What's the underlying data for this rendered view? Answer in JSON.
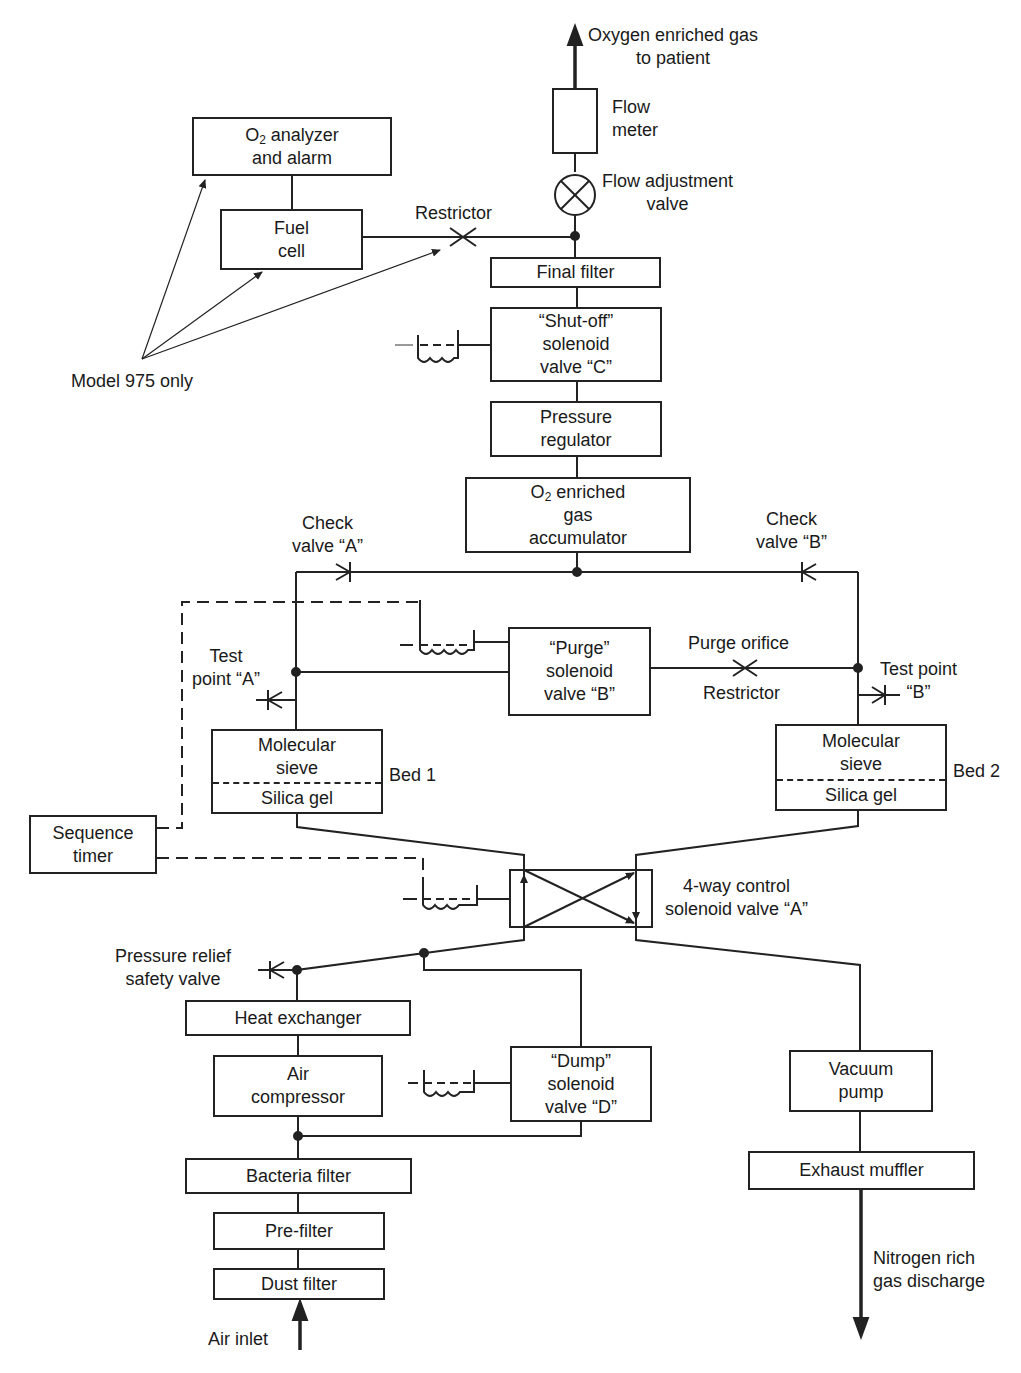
{
  "outputs": {
    "top": [
      "Oxygen enriched gas",
      "to patient"
    ],
    "bottom": [
      "Nitrogen rich",
      "gas discharge"
    ],
    "inlet": "Air inlet"
  },
  "components": {
    "flow_meter": [
      "Flow",
      "meter"
    ],
    "flow_adjustment_valve": [
      "Flow adjustment",
      "valve"
    ],
    "o2_analyzer": {
      "o": "O",
      "sub": "2",
      "rest": " analyzer",
      "line2": "and alarm"
    },
    "fuel_cell": [
      "Fuel",
      "cell"
    ],
    "restrictor_top": "Restrictor",
    "model_note": "Model 975 only",
    "final_filter": "Final filter",
    "shutoff_valve": [
      "“Shut-off”",
      "solenoid",
      "valve “C”"
    ],
    "pressure_regulator": [
      "Pressure",
      "regulator"
    ],
    "accumulator": {
      "o": "O",
      "sub": "2",
      "rest": " enriched",
      "line2": "gas",
      "line3": "accumulator"
    },
    "check_valve_a": [
      "Check",
      "valve “A”"
    ],
    "check_valve_b": [
      "Check",
      "valve “B”"
    ],
    "purge_valve": [
      "“Purge”",
      "solenoid",
      "valve “B”"
    ],
    "purge_orifice": "Purge orifice",
    "restrictor_mid": "Restrictor",
    "test_point_a": [
      "Test",
      "point “A”"
    ],
    "test_point_b": [
      "Test point",
      "“B”"
    ],
    "bed1": {
      "top": [
        "Molecular",
        "sieve"
      ],
      "bottom": "Silica gel",
      "label": "Bed 1"
    },
    "bed2": {
      "top": [
        "Molecular",
        "sieve"
      ],
      "bottom": "Silica gel",
      "label": "Bed 2"
    },
    "sequence_timer": [
      "Sequence",
      "timer"
    ],
    "four_way_valve": [
      "4-way control",
      "solenoid valve “A”"
    ],
    "pressure_relief": [
      "Pressure relief",
      "safety valve"
    ],
    "heat_exchanger": "Heat exchanger",
    "air_compressor": [
      "Air",
      "compressor"
    ],
    "dump_valve": [
      "“Dump”",
      "solenoid",
      "valve “D”"
    ],
    "bacteria_filter": "Bacteria filter",
    "pre_filter": "Pre-filter",
    "dust_filter": "Dust filter",
    "vacuum_pump": [
      "Vacuum",
      "pump"
    ],
    "exhaust_muffler": "Exhaust muffler"
  },
  "colors": {
    "line": "#222222",
    "background": "#ffffff"
  }
}
